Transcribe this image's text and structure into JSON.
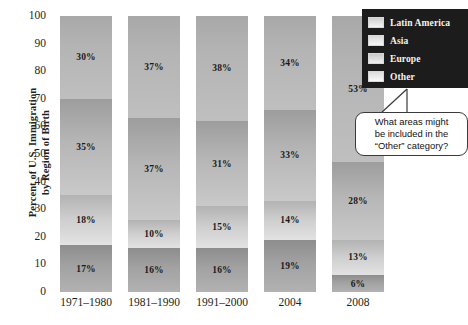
{
  "chart_data": {
    "type": "bar",
    "subtype": "stacked-100",
    "title": "",
    "xlabel": "",
    "ylabel": "Percent of U.S. Immigration by Region of Birth",
    "ylabel_lines": [
      "Percent of U.S. Immigration",
      "by Region of Birth"
    ],
    "ylim": [
      0,
      100
    ],
    "yticks": [
      100,
      90,
      80,
      70,
      60,
      50,
      40,
      30,
      20,
      10,
      0
    ],
    "grid": false,
    "legend_position": "top-right",
    "categories": [
      "1971–1980",
      "1981–1990",
      "1991–2000",
      "2004",
      "2008"
    ],
    "series": [
      {
        "name": "Latin America",
        "values": [
          17,
          16,
          16,
          19,
          6
        ],
        "labels": [
          "17%",
          "16%",
          "16%",
          "19%",
          "6%"
        ],
        "color": "#a2a2a2",
        "stack_order": 0
      },
      {
        "name": "Asia",
        "values": [
          18,
          10,
          15,
          14,
          13
        ],
        "labels": [
          "18%",
          "10%",
          "15%",
          "14%",
          "13%"
        ],
        "color": "#cfcfcf",
        "stack_order": 1
      },
      {
        "name": "Europe",
        "values": [
          35,
          37,
          31,
          33,
          28
        ],
        "labels": [
          "35%",
          "37%",
          "31%",
          "33%",
          "28%"
        ],
        "color": "#b6b6b6",
        "stack_order": 2
      },
      {
        "name": "Other",
        "values": [
          30,
          37,
          38,
          34,
          53
        ],
        "labels": [
          "30%",
          "37%",
          "38%",
          "34%",
          "53%"
        ],
        "color": "#b4b4b4",
        "stack_order": 3
      }
    ],
    "annotations": [
      {
        "text": "What areas might be included in the “Other” category?",
        "lines": [
          "What areas might",
          "be included in the",
          "“Other” category?"
        ],
        "points_to": "legend"
      }
    ]
  },
  "legend": {
    "items": [
      {
        "label": "Latin America"
      },
      {
        "label": "Asia"
      },
      {
        "label": "Europe"
      },
      {
        "label": "Other"
      }
    ],
    "background_color": "#1c1c1c",
    "text_color": "#f5f2ea"
  }
}
